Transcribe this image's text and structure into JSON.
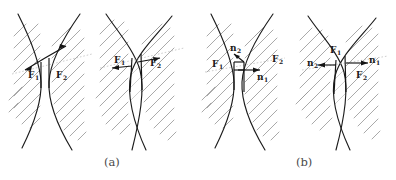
{
  "figure": {
    "type": "scientific-diagram",
    "background_color": "#ffffff",
    "outline_color": "#1c1c1c",
    "hatch_color": "#9a9a9a",
    "guide_color": "#b9b9b9",
    "vector_color": "#141414",
    "caption_color": "#4a4a4a"
  },
  "panels": [
    {
      "id": "a",
      "caption": "(a)",
      "caption_x": 104,
      "caption_y": 166,
      "subpanels": [
        {
          "id": "a1",
          "name": "gap-configuration",
          "vectors": [
            {
              "label": "F",
              "subscript": "1",
              "direction": "down-left",
              "label_x": 28,
              "label_y": 76
            },
            {
              "label": "F",
              "subscript": "2",
              "direction": "up-right",
              "label_x": 57,
              "label_y": 76
            }
          ]
        },
        {
          "id": "a2",
          "name": "overlap-configuration",
          "vectors": [
            {
              "label": "F",
              "subscript": "1",
              "direction": "left",
              "label_x": 116,
              "label_y": 63
            },
            {
              "label": "F",
              "subscript": "2",
              "direction": "right",
              "label_x": 152,
              "label_y": 65
            }
          ]
        }
      ]
    },
    {
      "id": "b",
      "caption": "(b)",
      "caption_x": 296,
      "caption_y": 166,
      "subpanels": [
        {
          "id": "b1",
          "name": "gap-configuration-normals",
          "vectors": [
            {
              "label": "n",
              "subscript": "2",
              "direction": "up-left",
              "label_x": 232,
              "label_y": 50
            },
            {
              "label": "n",
              "subscript": "1",
              "direction": "right",
              "label_x": 260,
              "label_y": 76
            },
            {
              "label": "F",
              "subscript": "1",
              "direction": "label-only",
              "label_x": 216,
              "label_y": 64
            },
            {
              "label": "F",
              "subscript": "2",
              "direction": "label-only",
              "label_x": 277,
              "label_y": 60
            }
          ]
        },
        {
          "id": "b2",
          "name": "overlap-configuration-normals",
          "vectors": [
            {
              "label": "n",
              "subscript": "2",
              "direction": "left",
              "label_x": 311,
              "label_y": 65
            },
            {
              "label": "n",
              "subscript": "1",
              "direction": "right",
              "label_x": 372,
              "label_y": 62
            },
            {
              "label": "F",
              "subscript": "1",
              "direction": "label-only",
              "label_x": 334,
              "label_y": 52
            },
            {
              "label": "F",
              "subscript": "2",
              "direction": "label-only",
              "label_x": 360,
              "label_y": 75
            }
          ]
        }
      ]
    }
  ]
}
